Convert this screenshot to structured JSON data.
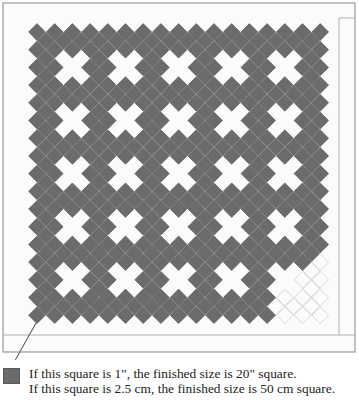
{
  "diagram": {
    "colors": {
      "diamond_fill": "#6b6b6b",
      "diamond_edge": "#4f4f4f",
      "border_line": "#9a9a9a",
      "ghost_outline": "#cfcfcf",
      "background": "#ffffff",
      "quilt_background": "#f7f7f7"
    },
    "grid": {
      "rows": 33,
      "cols": 33,
      "origin_x": 37,
      "origin_y": 32,
      "step": 8.85,
      "half_diagonal": 8.4,
      "fill_rule": "gray where (row+col) is even"
    },
    "crosses": {
      "description": "white X motifs: center diamond plus four diagonal neighbors removed",
      "positions": [
        4,
        10,
        16,
        22,
        28
      ]
    },
    "borders": {
      "outer": {
        "x": 3,
        "y": 3,
        "width": 352,
        "height": 349
      },
      "inner_vertical_x": 339,
      "inner_vertical_top": 18,
      "inner_horizontal_y": 335
    },
    "arrow": {
      "from": [
        36,
        323
      ],
      "to": [
        11,
        368
      ]
    }
  },
  "legend": {
    "swatch_label": "sample square",
    "line1": "If this square is 1\", the finished size is 20\" square.",
    "line2": "If this square is 2.5 cm, the finished size is 50 cm square."
  }
}
